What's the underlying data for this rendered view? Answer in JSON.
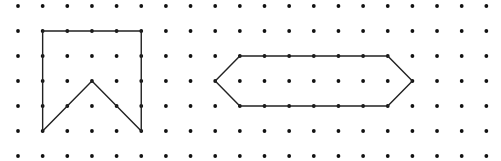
{
  "grid": {
    "columns": 20,
    "rows": 7,
    "origin_x": 18,
    "origin_y": 6,
    "spacing_x": 24.65,
    "spacing_y": 25,
    "dot_radius": 1.9,
    "dot_color": "#111111"
  },
  "shapes": [
    {
      "name": "pentagon-notched-shape",
      "stroke": "#222222",
      "stroke_width": 1.4,
      "points": [
        [
          1,
          1
        ],
        [
          5,
          1
        ],
        [
          5,
          5
        ],
        [
          3,
          3
        ],
        [
          1,
          5
        ]
      ]
    },
    {
      "name": "hexagon-shape",
      "stroke": "#222222",
      "stroke_width": 1.4,
      "points": [
        [
          8,
          3
        ],
        [
          9,
          2
        ],
        [
          15,
          2
        ],
        [
          16,
          3
        ],
        [
          15,
          4
        ],
        [
          9,
          4
        ]
      ]
    }
  ]
}
